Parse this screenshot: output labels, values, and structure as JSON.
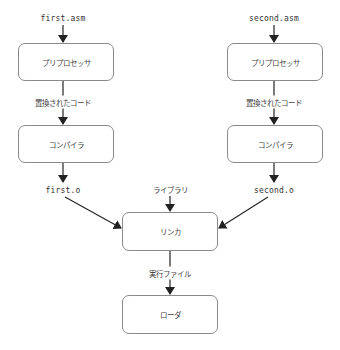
{
  "diagram": {
    "type": "flowchart",
    "title": "",
    "nodes": {
      "first_asm": "first.asm",
      "second_asm": "second.asm",
      "preprocessor_left": "プリプロセッサ",
      "preprocessor_right": "プリプロセッサ",
      "replaced_code_left": "置換されたコード",
      "replaced_code_right": "置換されたコード",
      "compiler_left": "コンパイラ",
      "compiler_right": "コンパイラ",
      "first_o": "first.o",
      "second_o": "second.o",
      "library": "ライブラリ",
      "linker": "リンカ",
      "executable": "実行ファイル",
      "loader": "ローダ"
    },
    "edges": [
      {
        "from": "first.asm",
        "to": "プリプロセッサ (left)"
      },
      {
        "from": "プリプロセッサ (left)",
        "to": "コンパイラ (left)",
        "label": "置換されたコード"
      },
      {
        "from": "コンパイラ (left)",
        "to": "first.o"
      },
      {
        "from": "first.o",
        "to": "リンカ"
      },
      {
        "from": "second.asm",
        "to": "プリプロセッサ (right)"
      },
      {
        "from": "プリプロセッサ (right)",
        "to": "コンパイラ (right)",
        "label": "置換されたコード"
      },
      {
        "from": "コンパイラ (right)",
        "to": "second.o"
      },
      {
        "from": "second.o",
        "to": "リンカ"
      },
      {
        "from": "ライブラリ",
        "to": "リンカ"
      },
      {
        "from": "リンカ",
        "to": "ローダ",
        "label": "実行ファイル"
      }
    ],
    "colors": {
      "box_border": "#8a8a8a",
      "arrow": "#222222",
      "text": "#444444"
    }
  }
}
